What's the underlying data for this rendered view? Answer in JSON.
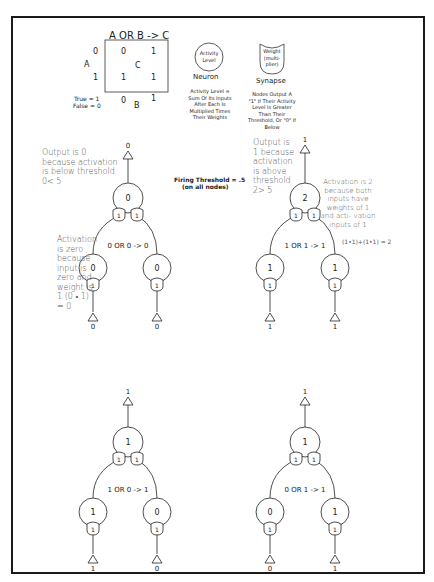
{
  "truth_table": {
    "title": "A OR B -> C",
    "a_label": "A",
    "b_label": "B",
    "c_label": "C",
    "row_values": [
      "0",
      "1"
    ],
    "col_values": [
      "0",
      "1"
    ],
    "cells": [
      [
        "0",
        "1"
      ],
      [
        "1",
        "1"
      ]
    ],
    "legend_true": "True = 1",
    "legend_false": "False = 0"
  },
  "legend": {
    "neuron": {
      "inside": "Activity Level",
      "label": "Neuron",
      "description": "Activity Level = Sum Of Its Inputs After Each Is Multiplied Times Their Weights"
    },
    "synapse": {
      "inside": "Weight (multi-plier)",
      "label": "Synapse",
      "description": "Nodes Output A \"1\" If Their Activity Level Is Greater Than Their Threshold, Or \"0\" If Below"
    }
  },
  "threshold": {
    "line1": "Firing Threshold = .5",
    "line2": "(on all nodes)"
  },
  "networks": [
    {
      "id": "0-or-0",
      "expression": "0 OR 0 -> 0",
      "output": "0",
      "output_node": "0",
      "input_nodes": [
        "0",
        "0"
      ],
      "inputs": [
        "0",
        "0"
      ],
      "weights_top": [
        "1",
        "1"
      ],
      "weights_bottom": [
        "1",
        "1"
      ]
    },
    {
      "id": "1-or-1",
      "expression": "1 OR 1 -> 1",
      "output": "1",
      "output_node": "2",
      "input_nodes": [
        "1",
        "1"
      ],
      "inputs": [
        "1",
        "1"
      ],
      "weights_top": [
        "1",
        "1"
      ],
      "weights_bottom": [
        "1",
        "1"
      ]
    },
    {
      "id": "1-or-0",
      "expression": "1 OR 0 -> 1",
      "output": "1",
      "output_node": "1",
      "input_nodes": [
        "1",
        "0"
      ],
      "inputs": [
        "1",
        "0"
      ],
      "weights_top": [
        "1",
        "1"
      ],
      "weights_bottom": [
        "1",
        "1"
      ]
    },
    {
      "id": "0-or-1",
      "expression": "0 OR 1 -> 1",
      "output": "1",
      "output_node": "1",
      "input_nodes": [
        "0",
        "1"
      ],
      "inputs": [
        "0",
        "1"
      ],
      "weights_top": [
        "1",
        "1"
      ],
      "weights_bottom": [
        "1",
        "1"
      ]
    }
  ],
  "annotations": {
    "output_zero": "Output is 0 because activation is below threshold. 0< 5",
    "activation_zero": "Activation is zero , because input is zero and weight is 1 (0 • 1) = 0",
    "output_one": "Output is 1 because activation is above threshold 2> 5",
    "activation_two": "Activation is 2 because both inputs have weights of 1 and acti- vation inputs of 1",
    "activation_two_formula": "(1•1)+(1•1) = 2"
  }
}
